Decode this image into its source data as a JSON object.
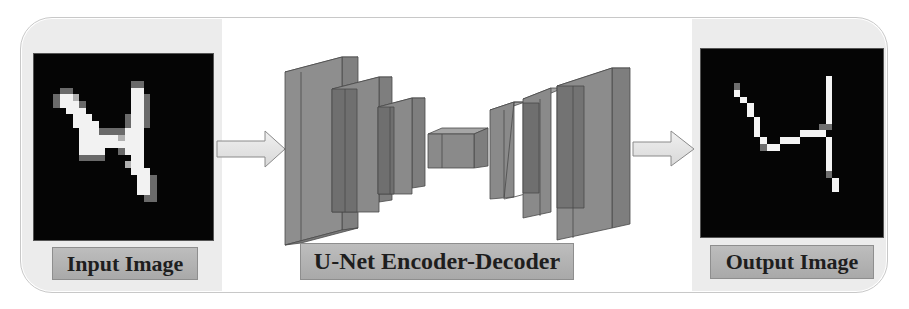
{
  "diagram": {
    "stages": [
      {
        "id": "input",
        "label": "Input Image",
        "content": "handwritten digit 4 (blurred grayscale)"
      },
      {
        "id": "network",
        "label": "U-Net Encoder-Decoder",
        "content": "encoder blocks shrinking to bottleneck, decoder blocks expanding"
      },
      {
        "id": "output",
        "label": "Output Image",
        "content": "thin skeleton of digit 4"
      }
    ],
    "arrows": [
      {
        "from": "input",
        "to": "network"
      },
      {
        "from": "network",
        "to": "output"
      }
    ],
    "colors": {
      "block_fill": "#8c8c8c",
      "block_dark": "#6e6e6e",
      "block_edge": "#4a4a4a",
      "arrow_fill": "#e4e4e4",
      "arrow_edge": "#8a8a8a",
      "label_fill": "#b4b4b4",
      "image_bg": "#050505"
    }
  }
}
